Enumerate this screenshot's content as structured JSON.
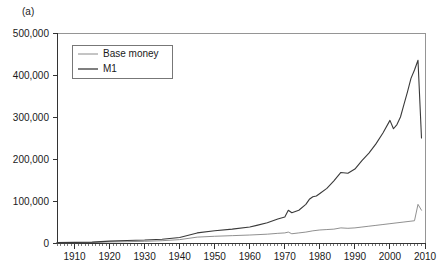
{
  "figure": {
    "panel_label": "(a)",
    "background": "#ffffff"
  },
  "legend": {
    "position": "top-left-inside",
    "entries": [
      {
        "label": "Base money",
        "color": "#8a8a8a",
        "width": 1.0
      },
      {
        "label": "M1",
        "color": "#3a3a3a",
        "width": 1.2
      }
    ]
  },
  "chart_data": {
    "type": "line",
    "title": "",
    "subtitle": "",
    "xlabel": "",
    "ylabel": "",
    "xlim": [
      1905,
      2010
    ],
    "ylim": [
      0,
      500000
    ],
    "grid": false,
    "legend_position": "upper left",
    "y_ticks": [
      0,
      100000,
      200000,
      300000,
      400000,
      500000
    ],
    "y_tick_labels": [
      "0",
      "100,000",
      "200,000",
      "300,000",
      "400,000",
      "500,000"
    ],
    "x_ticks": [
      1910,
      1920,
      1930,
      1940,
      1950,
      1960,
      1970,
      1980,
      1990,
      2000,
      2010
    ],
    "x_tick_labels": [
      "1910",
      "1920",
      "1930",
      "1940",
      "1950",
      "1960",
      "1970",
      "1980",
      "1990",
      "2000",
      "2010"
    ],
    "x_minor_tick_step": 1,
    "series": [
      {
        "name": "Base money",
        "color": "#8a8a8a",
        "x": [
          1905,
          1910,
          1915,
          1920,
          1925,
          1930,
          1935,
          1940,
          1945,
          1950,
          1955,
          1960,
          1965,
          1968,
          1970,
          1971,
          1972,
          1974,
          1976,
          1978,
          1980,
          1982,
          1984,
          1986,
          1988,
          1990,
          1992,
          1994,
          1996,
          1998,
          2000,
          2002,
          2004,
          2006,
          2007,
          2008,
          2009
        ],
        "values": [
          600,
          800,
          1200,
          2500,
          3200,
          4000,
          5500,
          8000,
          14000,
          16000,
          17500,
          19000,
          21000,
          23000,
          24000,
          26000,
          22000,
          24000,
          26000,
          29000,
          31000,
          32000,
          33000,
          36000,
          35000,
          36000,
          38000,
          40000,
          42000,
          44000,
          46000,
          48000,
          50000,
          52000,
          53000,
          92000,
          78000
        ]
      },
      {
        "name": "M1",
        "color": "#3a3a3a",
        "x": [
          1905,
          1910,
          1915,
          1920,
          1925,
          1930,
          1935,
          1940,
          1945,
          1950,
          1955,
          1960,
          1962,
          1965,
          1968,
          1970,
          1971,
          1972,
          1974,
          1976,
          1977,
          1978,
          1979,
          1980,
          1982,
          1984,
          1986,
          1988,
          1990,
          1992,
          1994,
          1996,
          1998,
          2000,
          2001,
          2002,
          2003,
          2004,
          2005,
          2006,
          2007,
          2008,
          2009
        ],
        "values": [
          900,
          1400,
          2200,
          4500,
          6000,
          7000,
          9000,
          13000,
          24000,
          29000,
          33000,
          38000,
          42000,
          48000,
          57000,
          62000,
          78000,
          72000,
          78000,
          92000,
          104000,
          110000,
          112000,
          118000,
          130000,
          148000,
          168000,
          166000,
          176000,
          196000,
          214000,
          236000,
          262000,
          292000,
          272000,
          282000,
          300000,
          330000,
          360000,
          392000,
          412000,
          435000,
          250000
        ]
      }
    ]
  },
  "axes": {
    "plot_left_px": 57,
    "plot_top_px": 33,
    "plot_right_px": 425,
    "plot_bottom_px": 243
  }
}
